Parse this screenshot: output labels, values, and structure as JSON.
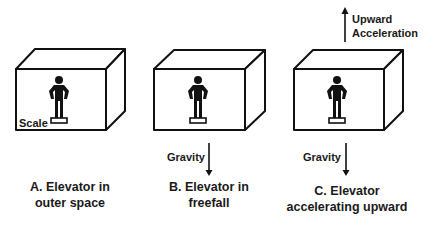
{
  "diagram": {
    "panels": [
      {
        "id": "A",
        "caption_line1": "A. Elevator in",
        "caption_line2": "outer space",
        "scale_label": "Scale",
        "arrows": []
      },
      {
        "id": "B",
        "caption_line1": "B. Elevator in",
        "caption_line2": "freefall",
        "arrows": [
          {
            "label": "Gravity",
            "direction": "down"
          }
        ]
      },
      {
        "id": "C",
        "caption_line1": "C. Elevator",
        "caption_line2": "accelerating upward",
        "arrows": [
          {
            "label": "Gravity",
            "direction": "down"
          },
          {
            "label_line1": "Upward",
            "label_line2": "Acceleration",
            "direction": "up"
          }
        ]
      }
    ],
    "colors": {
      "ink": "#111111",
      "background": "#ffffff"
    }
  }
}
